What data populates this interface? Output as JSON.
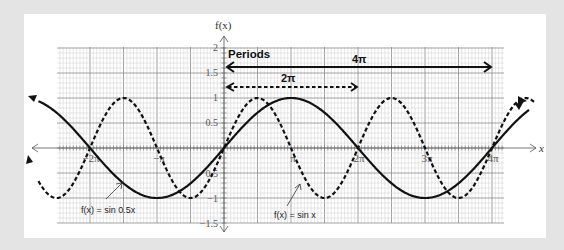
{
  "chart_data": {
    "type": "line",
    "title": "",
    "xlabel": "x",
    "ylabel": "f(x)",
    "xlim": [
      -8.0,
      14.5
    ],
    "ylim": [
      -1.5,
      2
    ],
    "grid": true,
    "x_ticks": [
      {
        "value": -6.2832,
        "label": "−2π"
      },
      {
        "value": -3.1416,
        "label": "−π"
      },
      {
        "value": 3.1416,
        "label": "π"
      },
      {
        "value": 6.2832,
        "label": "2π"
      },
      {
        "value": 9.4248,
        "label": "3π"
      },
      {
        "value": 12.5664,
        "label": "4π"
      }
    ],
    "y_ticks": [
      {
        "value": 2,
        "label": "2"
      },
      {
        "value": 1.5,
        "label": "1.5"
      },
      {
        "value": 1,
        "label": "1"
      },
      {
        "value": 0.5,
        "label": "0.5"
      },
      {
        "value": -0.5,
        "label": "0.5"
      },
      {
        "value": -1,
        "label": "−1"
      },
      {
        "value": -1.5,
        "label": "−1.5"
      }
    ],
    "series": [
      {
        "name": "f(x) = sin 0.5x",
        "style": "solid",
        "function": "sin(0.5x)",
        "x_range": [
          -8.7,
          14.3
        ],
        "period": "4π"
      },
      {
        "name": "f(x) = sin x",
        "style": "dashed",
        "function": "sin(x)",
        "x_range": [
          -8.7,
          14.6
        ],
        "period": "2π"
      }
    ],
    "annotations": [
      {
        "text": "Periods",
        "x": 0.1,
        "y": 1.8
      },
      {
        "text": "4π",
        "type": "arrow",
        "style": "solid",
        "from": 0,
        "to": 12.566,
        "y": 1.6
      },
      {
        "text": "2π",
        "type": "arrow",
        "style": "dashed",
        "from": 0,
        "to": 6.283,
        "y": 1.2
      }
    ]
  },
  "labels": {
    "y_axis": "f(x)",
    "x_axis": "x",
    "periods": "Periods",
    "period_4pi": "4π",
    "period_2pi": "2π",
    "tick_neg2pi": "−2π",
    "tick_negpi": "−π",
    "tick_pi": "π",
    "tick_2pi": "2π",
    "tick_3pi": "3π",
    "tick_4pi": "4π",
    "y_2": "2",
    "y_15": "1.5",
    "y_1": "1",
    "y_05": "0.5",
    "y_m05": "0.5",
    "y_m1": "−1",
    "y_m15": "−1.5",
    "legend_sin05": "f(x) = sin 0.5x",
    "legend_sin": "f(x) = sin x"
  }
}
